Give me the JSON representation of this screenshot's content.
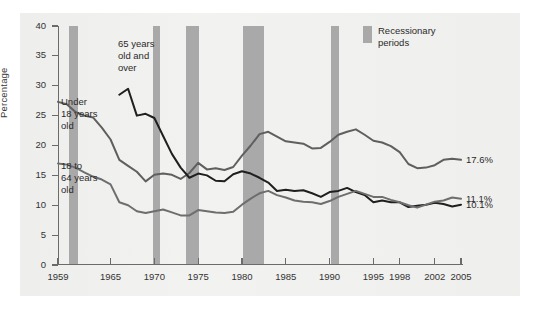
{
  "chart_data": {
    "type": "line",
    "title": "",
    "xlabel": "",
    "ylabel": "Percentage",
    "xlim": [
      1959,
      2005
    ],
    "ylim": [
      0,
      40
    ],
    "ytick_labels": [
      "0",
      "5",
      "10",
      "15",
      "20",
      "25",
      "30",
      "35",
      "40"
    ],
    "ytick_values": [
      0,
      5,
      10,
      15,
      20,
      25,
      30,
      35,
      40
    ],
    "xtick_labels": [
      "1959",
      "1965",
      "1970",
      "1975",
      "1980",
      "1985",
      "1990",
      "1995",
      "1998",
      "2002",
      "2005"
    ],
    "xtick_values": [
      1959,
      1965,
      1970,
      1975,
      1980,
      1985,
      1990,
      1995,
      1998,
      2002,
      2005
    ],
    "grid": false,
    "legend_position": "top-right",
    "legend": [
      {
        "label": "Recessionary\nperiods",
        "color": "#a9a9a9",
        "type": "band"
      }
    ],
    "series": [
      {
        "name": "Under 18 years old",
        "color": "#5f5f5f",
        "end_label": "17.6%",
        "x": [
          1959,
          1960,
          1961,
          1962,
          1963,
          1964,
          1965,
          1966,
          1967,
          1968,
          1969,
          1970,
          1971,
          1972,
          1973,
          1974,
          1975,
          1976,
          1977,
          1978,
          1979,
          1980,
          1981,
          1982,
          1983,
          1984,
          1985,
          1986,
          1987,
          1988,
          1989,
          1990,
          1991,
          1992,
          1993,
          1994,
          1995,
          1996,
          1997,
          1998,
          1999,
          2000,
          2001,
          2002,
          2003,
          2004,
          2005
        ],
        "y": [
          27.3,
          26.9,
          25.6,
          25.0,
          24.7,
          23.0,
          21.0,
          17.6,
          16.6,
          15.6,
          14.0,
          15.1,
          15.3,
          15.1,
          14.4,
          15.4,
          17.1,
          16.0,
          16.2,
          15.9,
          16.4,
          18.3,
          20.0,
          21.9,
          22.3,
          21.5,
          20.7,
          20.5,
          20.3,
          19.5,
          19.6,
          20.6,
          21.8,
          22.3,
          22.7,
          21.8,
          20.8,
          20.5,
          19.9,
          18.9,
          16.9,
          16.2,
          16.3,
          16.7,
          17.6,
          17.8,
          17.6
        ]
      },
      {
        "name": "65 years old and over",
        "color": "#1f1f1f",
        "end_label": "10.1%",
        "x": [
          1966,
          1967,
          1968,
          1969,
          1970,
          1971,
          1972,
          1973,
          1974,
          1975,
          1976,
          1977,
          1978,
          1979,
          1980,
          1981,
          1982,
          1983,
          1984,
          1985,
          1986,
          1987,
          1988,
          1989,
          1990,
          1991,
          1992,
          1993,
          1994,
          1995,
          1996,
          1997,
          1998,
          1999,
          2000,
          2001,
          2002,
          2003,
          2004,
          2005
        ],
        "y": [
          28.5,
          29.5,
          25.0,
          25.3,
          24.6,
          21.6,
          18.6,
          16.3,
          14.6,
          15.3,
          15.0,
          14.1,
          14.0,
          15.2,
          15.7,
          15.3,
          14.6,
          13.8,
          12.4,
          12.6,
          12.4,
          12.5,
          12.0,
          11.4,
          12.2,
          12.4,
          12.9,
          12.2,
          11.7,
          10.5,
          10.8,
          10.5,
          10.5,
          9.7,
          9.9,
          10.1,
          10.4,
          10.2,
          9.8,
          10.1
        ]
      },
      {
        "name": "18 to 64 years old",
        "color": "#6e6e6e",
        "end_label": "11.1%",
        "x": [
          1959,
          1960,
          1961,
          1962,
          1963,
          1964,
          1965,
          1966,
          1967,
          1968,
          1969,
          1970,
          1971,
          1972,
          1973,
          1974,
          1975,
          1976,
          1977,
          1978,
          1979,
          1980,
          1981,
          1982,
          1983,
          1984,
          1985,
          1986,
          1987,
          1988,
          1989,
          1990,
          1991,
          1992,
          1993,
          1994,
          1995,
          1996,
          1997,
          1998,
          1999,
          2000,
          2001,
          2002,
          2003,
          2004,
          2005
        ],
        "y": [
          17.0,
          16.8,
          16.3,
          15.5,
          14.8,
          14.3,
          13.5,
          10.5,
          10.0,
          9.0,
          8.7,
          9.0,
          9.3,
          8.8,
          8.3,
          8.3,
          9.2,
          9.0,
          8.8,
          8.7,
          8.9,
          10.1,
          11.1,
          12.0,
          12.4,
          11.7,
          11.3,
          10.8,
          10.6,
          10.5,
          10.2,
          10.7,
          11.4,
          11.9,
          12.4,
          11.9,
          11.4,
          11.4,
          10.9,
          10.5,
          10.0,
          9.6,
          10.1,
          10.6,
          10.8,
          11.3,
          11.1
        ]
      }
    ],
    "recession_bands": [
      {
        "start": 1960.2,
        "end": 1961.3
      },
      {
        "start": 1969.8,
        "end": 1970.6
      },
      {
        "start": 1973.6,
        "end": 1975.1
      },
      {
        "start": 1980.1,
        "end": 1982.5
      },
      {
        "start": 1990.2,
        "end": 1991.1
      }
    ],
    "annotations": [
      {
        "text": "65 years\nold and\nover",
        "x_px": 118,
        "y_px": 38
      },
      {
        "text": "Under\n18 years\nold",
        "x_px": 61,
        "y_px": 96
      },
      {
        "text": "18 to\n64 years\nold",
        "x_px": 61,
        "y_px": 160
      }
    ]
  }
}
